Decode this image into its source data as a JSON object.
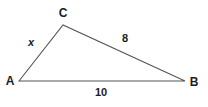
{
  "figure": {
    "type": "triangle-diagram",
    "background_color": "#ffffff",
    "stroke_color": "#555555",
    "text_color": "#1c1c1c",
    "width": 208,
    "height": 107
  },
  "vertices": [
    {
      "name": "A",
      "label": "A",
      "x": 19,
      "y": 81
    },
    {
      "name": "C",
      "label": "C",
      "x": 63,
      "y": 25
    },
    {
      "name": "B",
      "label": "B",
      "x": 185,
      "y": 81
    }
  ],
  "sides": [
    {
      "name": "AC",
      "label": "x",
      "from": "A",
      "to": "C",
      "label_x": 31,
      "label_y": 42,
      "style": "italic-variable"
    },
    {
      "name": "CB",
      "label": "8",
      "from": "C",
      "to": "B",
      "label_x": 125,
      "label_y": 38,
      "style": "number"
    },
    {
      "name": "AB",
      "label": "10",
      "from": "A",
      "to": "B",
      "label_x": 101,
      "label_y": 92,
      "style": "number"
    }
  ],
  "labels": {
    "vertex_a": "A",
    "vertex_b": "B",
    "vertex_c": "C",
    "side_ac": "x",
    "side_cb": "8",
    "side_ab": "10"
  }
}
